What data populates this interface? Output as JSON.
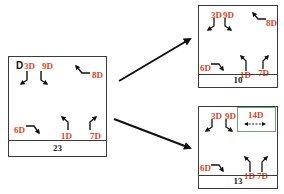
{
  "colors": {
    "label": "#d9451e",
    "border": "#3a3a3a",
    "arrow": "#111111",
    "highlight_box": "#6aa86a"
  },
  "left_panel": {
    "prefix": "D",
    "labels": {
      "l3": "3D",
      "l9": "9D",
      "l8": "8D",
      "l6": "6D",
      "l1": "1D",
      "l7": "7D"
    },
    "footer": "23"
  },
  "top_right_panel": {
    "labels": {
      "l3": "3D",
      "l9": "9D",
      "l8": "8D",
      "l6": "6D",
      "l1": "1D",
      "l7": "7D"
    },
    "footer": "10"
  },
  "bottom_right_panel": {
    "labels": {
      "l3": "3D",
      "l9": "9D",
      "l14": "14D",
      "l14_icon": "↔ (dashed double arrow)",
      "l6": "6D",
      "l1": "1D",
      "l7": "7D"
    },
    "footer": "13"
  },
  "transitions": [
    {
      "from": "left_panel",
      "to": "top_right_panel"
    },
    {
      "from": "left_panel",
      "to": "bottom_right_panel"
    }
  ]
}
